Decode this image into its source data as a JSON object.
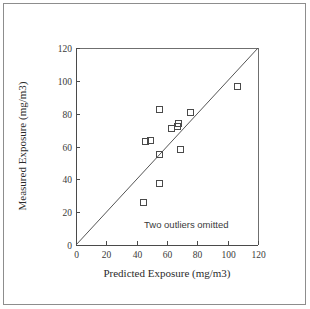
{
  "figure": {
    "border_color": "#8d8d8d",
    "background": "#ffffff"
  },
  "annotation": {
    "text": "Two outliers omitted"
  },
  "axes": {
    "x_title": "Predicted Exposure (mg/m3)",
    "y_title": "Measured Exposure (mg/m3)",
    "x_ticks": [
      "0",
      "20",
      "40",
      "60",
      "80",
      "100",
      "120"
    ],
    "y_ticks": [
      "0",
      "20",
      "40",
      "60",
      "80",
      "100",
      "120"
    ]
  },
  "chart_data": {
    "type": "scatter",
    "title": "",
    "xlabel": "Predicted Exposure (mg/m3)",
    "ylabel": "Measured Exposure (mg/m3)",
    "xlim": [
      0,
      120
    ],
    "ylim": [
      0,
      120
    ],
    "xticks": [
      0,
      20,
      40,
      60,
      80,
      100,
      120
    ],
    "yticks": [
      0,
      20,
      40,
      60,
      80,
      100,
      120
    ],
    "grid": false,
    "legend": null,
    "marker": "open-square",
    "marker_color": "#4a4a4a",
    "annotations": [
      {
        "text": "Two outliers omitted",
        "x": 60,
        "y": 12
      }
    ],
    "reference_line": {
      "name": "1:1 identity line",
      "x": [
        0,
        120
      ],
      "y": [
        0,
        120
      ],
      "color": "#555555"
    },
    "series": [
      {
        "name": "Exposure samples",
        "points": [
          {
            "x": 44.0,
            "y": 26.3
          },
          {
            "x": 45.5,
            "y": 63.5
          },
          {
            "x": 48.5,
            "y": 64.0
          },
          {
            "x": 54.5,
            "y": 83.0
          },
          {
            "x": 54.5,
            "y": 55.3
          },
          {
            "x": 55.0,
            "y": 38.0
          },
          {
            "x": 62.5,
            "y": 71.5
          },
          {
            "x": 66.5,
            "y": 72.3
          },
          {
            "x": 67.5,
            "y": 74.3
          },
          {
            "x": 68.5,
            "y": 58.5
          },
          {
            "x": 75.0,
            "y": 81.0
          },
          {
            "x": 106.0,
            "y": 97.0
          }
        ]
      }
    ]
  }
}
